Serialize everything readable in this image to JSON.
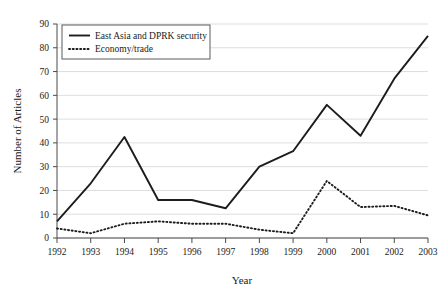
{
  "chart_data": {
    "type": "line",
    "title": "",
    "xlabel": "Year",
    "ylabel": "Number of Articles",
    "categories": [
      "1992",
      "1993",
      "1994",
      "1995",
      "1996",
      "1997",
      "1998",
      "1999",
      "2000",
      "2001",
      "2002",
      "2003"
    ],
    "x": [
      1992,
      1993,
      1994,
      1995,
      1996,
      1997,
      1998,
      1999,
      2000,
      2001,
      2002,
      2003
    ],
    "series": [
      {
        "name": "East Asia and DPRK security",
        "style": "solid",
        "color": "#1c1c1c",
        "values": [
          7,
          23,
          42.5,
          16,
          16,
          12.5,
          30,
          36.5,
          56,
          43,
          67,
          85
        ]
      },
      {
        "name": "Economy/trade",
        "style": "dotted",
        "color": "#1c1c1c",
        "values": [
          4,
          2,
          6,
          7,
          6,
          6,
          3.5,
          2,
          24,
          13,
          13.5,
          9.5
        ]
      }
    ],
    "ylim": [
      0,
      90
    ],
    "yticks": [
      0,
      10,
      20,
      30,
      40,
      50,
      60,
      70,
      80,
      90
    ],
    "ytick_labels": [
      "0",
      "10",
      "20",
      "30",
      "40",
      "50",
      "60",
      "70",
      "80",
      "90"
    ],
    "xtick_labels": [
      "1992",
      "1993",
      "1994",
      "1995",
      "1996",
      "1997",
      "1998",
      "1999",
      "2000",
      "2001",
      "2002",
      "2003"
    ],
    "grid": "horizontal",
    "legend_position": "top-left",
    "legend": [
      "East Asia and DPRK security",
      "Economy/trade"
    ]
  }
}
